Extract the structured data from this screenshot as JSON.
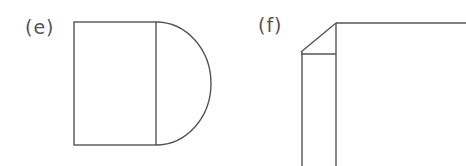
{
  "panels": [
    {
      "id": "e",
      "label": "(e)",
      "shape": "rectangle-with-semicircle"
    },
    {
      "id": "f",
      "label": "(f)",
      "shape": "rectangle-with-folded-corner"
    }
  ],
  "colors": {
    "line": "#555555",
    "background": "#ffffff"
  }
}
